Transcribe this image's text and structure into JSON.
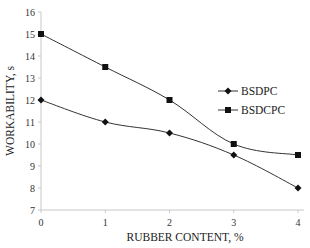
{
  "chart_data": {
    "type": "line",
    "title": "",
    "xlabel": "RUBBER CONTENT, %",
    "ylabel": "WORKABILITY, s",
    "x": [
      0,
      1,
      2,
      3,
      4
    ],
    "xticks": [
      "0",
      "1",
      "2",
      "3",
      "4"
    ],
    "yticks": [
      "7",
      "8",
      "9",
      "10",
      "11",
      "12",
      "13",
      "14",
      "15",
      "16"
    ],
    "xlim": [
      0,
      4
    ],
    "ylim": [
      7,
      16
    ],
    "grid": false,
    "legend_position": "right-center",
    "series": [
      {
        "name": "BSDPC",
        "marker": "diamond",
        "values": [
          12,
          11,
          10.5,
          9.5,
          8
        ]
      },
      {
        "name": "BSDCPC",
        "marker": "square",
        "values": [
          15,
          13.5,
          12,
          10,
          9.5
        ]
      }
    ],
    "line_color": "#333333",
    "axis_color": "#c8c8c8"
  }
}
